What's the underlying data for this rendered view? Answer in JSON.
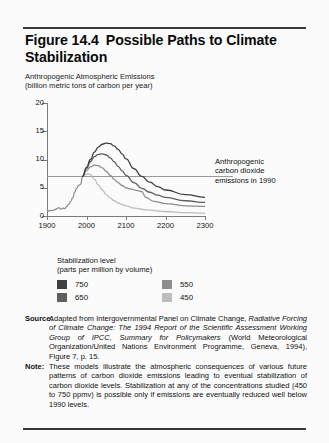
{
  "figure": {
    "title_line1": "Figure 14.4",
    "title_line2": "Possible Paths to Climate Stabilization",
    "caption_line1": "Anthropogenic Atmospheric Emissions",
    "caption_line2": "(billion metric tons of carbon per year)"
  },
  "annotation": {
    "line1": "Anthropogenic",
    "line2": "carbon dioxide",
    "line3": "emissions in 1990"
  },
  "legend": {
    "title_line1": "Stabilization level",
    "title_line2": "(parts per million by volume)",
    "items": [
      {
        "label": "750",
        "color": "#404040"
      },
      {
        "label": "650",
        "color": "#5e5e5e"
      },
      {
        "label": "550",
        "color": "#8e8e8e"
      },
      {
        "label": "450",
        "color": "#bdbdbd"
      }
    ]
  },
  "notes": {
    "source_label": "Source:",
    "source_part1": "Adapted from Intergovernmental Panel on Climate Change,",
    "source_italic1": "Radiative Forcing of Climate Change: The 1994 Report of the Scientific Assessment Working Group of IPCC, Summary for Policymakers",
    "source_part2": "(World Meteorological Organization/United Nations Environment Programme, Geneva, 1994), Figure 7, p. 15.",
    "note_label": "Note:",
    "note_text": "These models illustrate the atmospheric consequences of various future patterns of carbon dioxide emissions leading to eventual stabilization of carbon dioxide levels. Stabilization at any of the concentrations studied (450 to 750 ppmv) is possible only if emissions are eventually reduced well below 1990 levels."
  },
  "chart_data": {
    "type": "line",
    "title": "Possible Paths to Climate Stabilization",
    "xlabel": "",
    "ylabel": "Anthropogenic Atmospheric Emissions (billion metric tons of carbon per year)",
    "xlim": [
      1900,
      2300
    ],
    "ylim": [
      0,
      20
    ],
    "xticks": [
      1900,
      2000,
      2100,
      2200,
      2300
    ],
    "yticks": [
      0,
      5,
      10,
      15,
      20
    ],
    "grid": false,
    "legend_position": "below-plot",
    "reference_line": {
      "label": "Anthropogenic carbon dioxide emissions in 1990",
      "y": 7.0,
      "color": "#9a9a9a"
    },
    "historical": {
      "name": "historical emissions",
      "color": "#8e8e8e",
      "x": [
        1900,
        1910,
        1920,
        1925,
        1930,
        1935,
        1940,
        1945,
        1950,
        1955,
        1960,
        1965,
        1970,
        1975,
        1980,
        1985,
        1990
      ],
      "y": [
        0.8,
        1.0,
        1.1,
        1.3,
        1.5,
        1.2,
        1.4,
        1.3,
        1.7,
        2.1,
        2.6,
        3.2,
        4.2,
        4.9,
        5.4,
        5.6,
        7.0
      ]
    },
    "series": [
      {
        "name": "750",
        "color": "#404040",
        "x": [
          1990,
          2000,
          2010,
          2020,
          2030,
          2040,
          2050,
          2060,
          2070,
          2080,
          2090,
          2100,
          2120,
          2140,
          2160,
          2180,
          2200,
          2250,
          2300
        ],
        "y": [
          7.0,
          8.6,
          10.0,
          11.3,
          12.2,
          12.7,
          12.9,
          12.8,
          12.4,
          11.8,
          11.0,
          10.1,
          8.4,
          7.0,
          6.0,
          5.2,
          4.6,
          3.8,
          3.3
        ]
      },
      {
        "name": "650",
        "color": "#5e5e5e",
        "x": [
          1990,
          2000,
          2010,
          2020,
          2030,
          2040,
          2050,
          2060,
          2070,
          2080,
          2090,
          2100,
          2120,
          2140,
          2160,
          2180,
          2200,
          2250,
          2300
        ],
        "y": [
          7.0,
          8.4,
          9.6,
          10.5,
          10.9,
          11.0,
          10.8,
          10.3,
          9.6,
          8.8,
          8.0,
          7.2,
          5.9,
          4.9,
          4.2,
          3.7,
          3.3,
          2.7,
          2.4
        ]
      },
      {
        "name": "550",
        "color": "#8e8e8e",
        "x": [
          1990,
          2000,
          2010,
          2020,
          2030,
          2040,
          2050,
          2060,
          2070,
          2080,
          2090,
          2100,
          2110,
          2130,
          2140,
          2150,
          2170,
          2200,
          2250,
          2300
        ],
        "y": [
          7.0,
          8.0,
          8.7,
          9.0,
          8.9,
          8.5,
          7.9,
          7.2,
          6.5,
          5.9,
          5.4,
          5.0,
          4.8,
          4.5,
          4.3,
          3.3,
          2.6,
          2.2,
          1.8,
          1.7
        ]
      },
      {
        "name": "450",
        "color": "#bdbdbd",
        "x": [
          1990,
          2000,
          2005,
          2010,
          2020,
          2030,
          2040,
          2050,
          2060,
          2070,
          2080,
          2090,
          2100,
          2120,
          2150,
          2200,
          2250,
          2300
        ],
        "y": [
          7.0,
          7.4,
          7.5,
          7.3,
          6.5,
          5.5,
          4.6,
          3.8,
          3.2,
          2.7,
          2.3,
          2.0,
          1.8,
          1.4,
          1.1,
          0.8,
          0.6,
          0.5
        ]
      }
    ]
  }
}
